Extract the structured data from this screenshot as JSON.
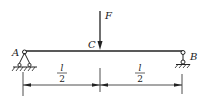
{
  "diagram": {
    "type": "simply-supported-beam",
    "colors": {
      "stroke": "#222222",
      "background": "#ffffff"
    },
    "labels": {
      "force": "F",
      "load_point": "C",
      "left_support": "A",
      "right_support": "B"
    },
    "dimensions": [
      {
        "numerator": "l",
        "denominator": "2"
      },
      {
        "numerator": "l",
        "denominator": "2"
      }
    ],
    "supports": {
      "left": "pin",
      "right": "roller"
    }
  }
}
